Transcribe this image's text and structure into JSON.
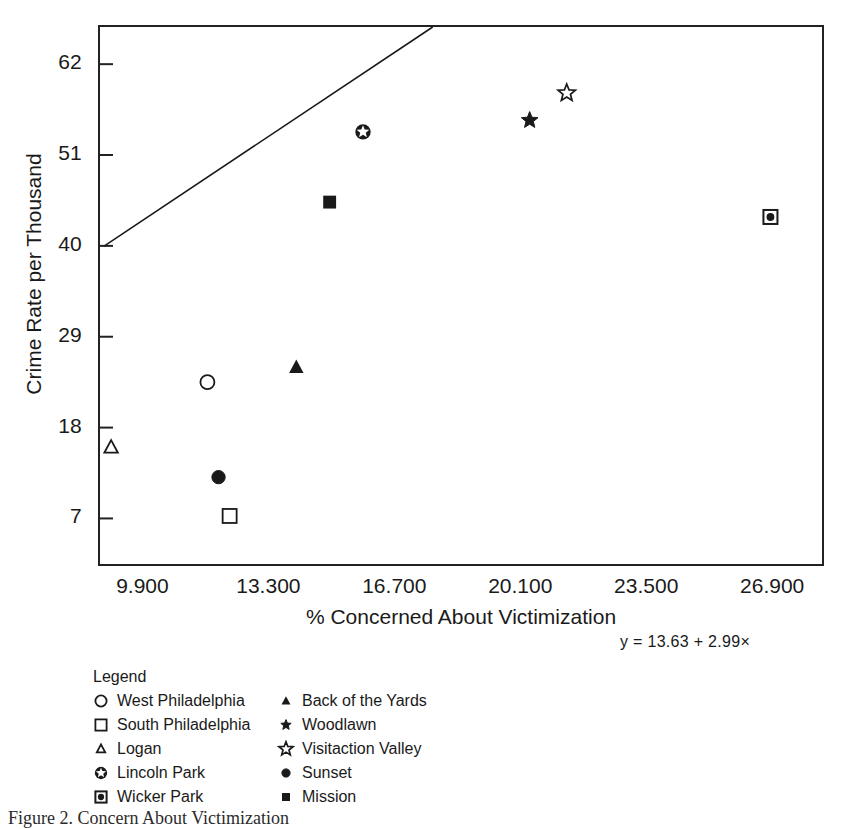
{
  "chart_data": {
    "type": "scatter",
    "title": "",
    "xlabel": "% Concerned About Victimization",
    "ylabel": "Crime Rate per Thousand",
    "xlim": [
      8.7,
      28.3
    ],
    "ylim": [
      1.0,
      66.5
    ],
    "xticks": [
      "9.900",
      "13.300",
      "16.700",
      "20.100",
      "23.500",
      "26.900"
    ],
    "xtick_values": [
      9.9,
      13.3,
      16.7,
      20.1,
      23.5,
      26.9
    ],
    "yticks": [
      "7",
      "18",
      "29",
      "40",
      "51",
      "62"
    ],
    "ytick_values": [
      7,
      18,
      29,
      40,
      51,
      62
    ],
    "grid": false,
    "legend_position": "below-plot",
    "regression": {
      "equation": "y = 13.63 + 2.99×",
      "intercept": 13.63,
      "slope": 2.99,
      "x_start": 8.8,
      "x_end": 23.9
    },
    "points": [
      {
        "label": "West Philadelphia",
        "marker": "open-circle",
        "x": 11.6,
        "y": 23.5
      },
      {
        "label": "South Philadelphia",
        "marker": "open-square",
        "x": 12.2,
        "y": 7.3
      },
      {
        "label": "Logan",
        "marker": "open-triangle",
        "x": 9.0,
        "y": 15.6
      },
      {
        "label": "Lincoln Park",
        "marker": "circle-star",
        "x": 15.8,
        "y": 53.8
      },
      {
        "label": "Wicker Park",
        "marker": "square-dot",
        "x": 26.8,
        "y": 43.5
      },
      {
        "label": "Back of the Yards",
        "marker": "filled-triangle",
        "x": 14.0,
        "y": 25.3
      },
      {
        "label": "Woodlawn",
        "marker": "filled-star",
        "x": 20.3,
        "y": 55.2
      },
      {
        "label": "Visitaction Valley",
        "marker": "open-star",
        "x": 21.3,
        "y": 58.5
      },
      {
        "label": "Sunset",
        "marker": "filled-circle",
        "x": 11.9,
        "y": 12.0
      },
      {
        "label": "Mission",
        "marker": "filled-square",
        "x": 14.9,
        "y": 45.3
      }
    ]
  },
  "axes": {
    "y_title": "Crime Rate per Thousand",
    "x_title": "% Concerned About Victimization",
    "y_tick_labels": [
      "62",
      "51",
      "40",
      "29",
      "18",
      "7"
    ],
    "x_tick_labels": [
      "9.900",
      "13.300",
      "16.700",
      "20.100",
      "23.500",
      "26.900"
    ]
  },
  "annotation": {
    "equation": "y = 13.63 + 2.99×"
  },
  "legend": {
    "title": "Legend",
    "entries": [
      {
        "label": "West Philadelphia",
        "marker": "open-circle"
      },
      {
        "label": "Back of the Yards",
        "marker": "filled-triangle"
      },
      {
        "label": "South Philadelphia",
        "marker": "open-square"
      },
      {
        "label": "Woodlawn",
        "marker": "filled-star"
      },
      {
        "label": "Logan",
        "marker": "open-triangle"
      },
      {
        "label": "Visitaction Valley",
        "marker": "open-star"
      },
      {
        "label": "Lincoln Park",
        "marker": "circle-star"
      },
      {
        "label": "Sunset",
        "marker": "filled-circle"
      },
      {
        "label": "Wicker Park",
        "marker": "square-dot"
      },
      {
        "label": "Mission",
        "marker": "filled-square"
      }
    ]
  },
  "caption": {
    "text": "Figure 2. Concern About Victimization"
  },
  "colors": {
    "ink": "#1a1a1a",
    "axis": "#222222",
    "background": "#ffffff"
  }
}
